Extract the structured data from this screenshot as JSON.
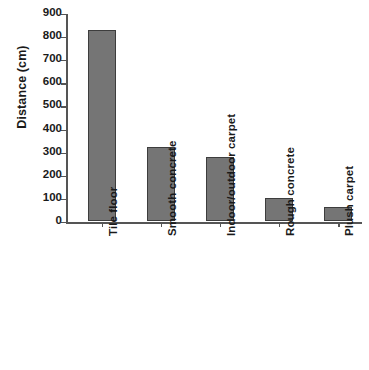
{
  "chart_data": {
    "type": "bar",
    "title": "",
    "xlabel": "",
    "ylabel": "Distance (cm)",
    "ylim": [
      0,
      900
    ],
    "ytick_step": 100,
    "yticks": [
      900,
      800,
      700,
      600,
      500,
      400,
      300,
      200,
      100,
      0
    ],
    "grid": false,
    "legend": null,
    "categories": [
      "Tile floor",
      "Smooth concrete",
      "Indoor/outdoor carpet",
      "Rough concrete",
      "Plush carpet"
    ],
    "values": [
      830,
      320,
      280,
      100,
      60
    ],
    "bar_color": "#757575",
    "bar_edge_color": "#3d3d3d",
    "axis_color": "#555555",
    "background_color": "#ffffff",
    "category_label_rotation": -90
  }
}
